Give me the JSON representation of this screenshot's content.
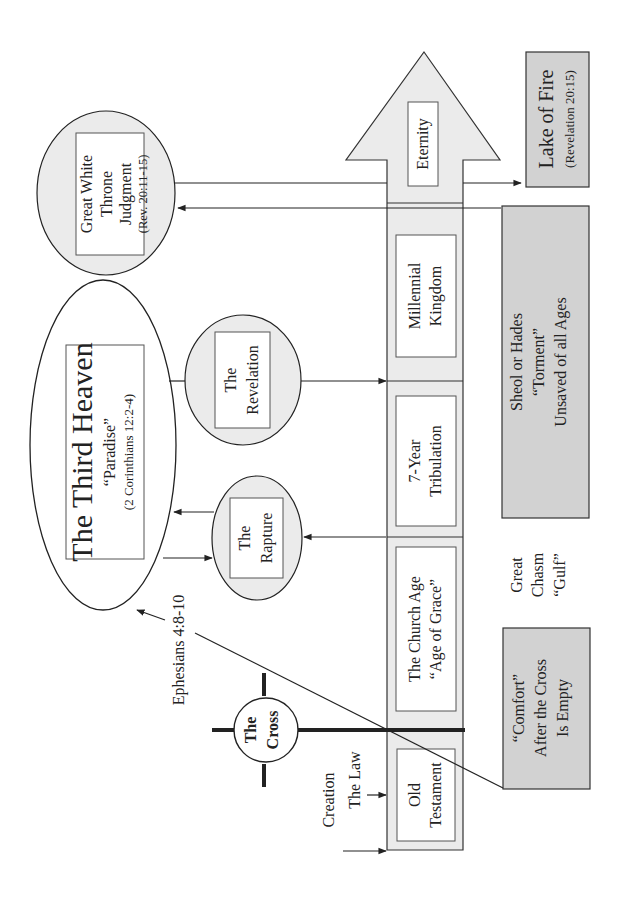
{
  "diagram": {
    "orientation": "rotated-90-ccw",
    "colors": {
      "background": "#ffffff",
      "light_fill": "#ebebeb",
      "box_fill": "#d2d2d2",
      "stroke": "#333333"
    },
    "timeline": {
      "periods": [
        {
          "line1": "Old",
          "line2": "Testament"
        },
        {
          "line1": "The Church Age",
          "line2": "“Age of Grace”"
        },
        {
          "line1": "7-Year",
          "line2": "Tribulation"
        },
        {
          "line1": "Millennial",
          "line2": "Kingdom"
        },
        {
          "line1": "Eternity"
        }
      ],
      "markers": {
        "creation": "Creation",
        "the_law": "The Law"
      }
    },
    "cross": {
      "line1": "The",
      "line2": "Cross"
    },
    "third_heaven": {
      "title": "The Third Heaven",
      "subtitle": "“Paradise”",
      "reference": "(2 Corinthians 12:2-4)"
    },
    "ephesians_label": "Ephesians 4:8-10",
    "rapture": {
      "line1": "The",
      "line2": "Rapture"
    },
    "revelation": {
      "line1": "The",
      "line2": "Revelation"
    },
    "great_white_throne": {
      "line1": "Great White",
      "line2": "Throne",
      "line3": "Judgment",
      "reference": "(Rev. 20:11-15)"
    },
    "lake_of_fire": {
      "title": "Lake of Fire",
      "reference": "(Revelation 20:15)"
    },
    "sheol": {
      "line1": "Sheol or Hades",
      "line2": "“Torment”",
      "line3": "Unsaved of all Ages"
    },
    "great_chasm": {
      "line1": "Great",
      "line2": "Chasm",
      "line3": "“Gulf”"
    },
    "comfort": {
      "line1": "“Comfort”",
      "line2": "After the Cross",
      "line3": "Is Empty"
    }
  }
}
